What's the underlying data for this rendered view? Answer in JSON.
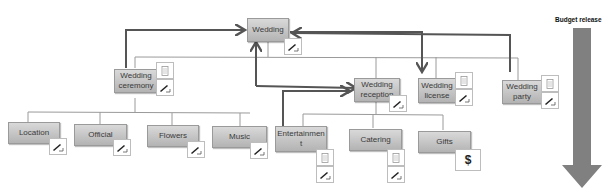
{
  "budget": {
    "label": "Budget release",
    "arrow_color": "#808080"
  },
  "root": {
    "label": "Wedding",
    "icons": [
      "pen-icon"
    ]
  },
  "level1": [
    {
      "label": "Wedding ceremony",
      "icons": [
        "document-icon",
        "pen-icon"
      ]
    },
    {
      "label": "Wedding reception",
      "icons": [
        "pen-icon"
      ]
    },
    {
      "label": "Wedding license",
      "icons": [
        "document-icon",
        "pen-icon"
      ]
    },
    {
      "label": "Wedding party",
      "icons": [
        "document-icon",
        "pen-icon"
      ]
    }
  ],
  "ceremony_children": [
    {
      "label": "Location",
      "icons": [
        "pen-icon"
      ]
    },
    {
      "label": "Official",
      "icons": [
        "pen-icon"
      ]
    },
    {
      "label": "Flowers",
      "icons": [
        "pen-icon"
      ]
    },
    {
      "label": "Music",
      "icons": [
        "pen-icon"
      ]
    }
  ],
  "reception_children": [
    {
      "label": "Entertainmen t",
      "icons": [
        "document-icon",
        "pen-icon"
      ]
    },
    {
      "label": "Catering",
      "icons": [
        "document-icon",
        "pen-icon"
      ]
    },
    {
      "label": "Gifts",
      "icons": [
        "dollar-icon"
      ],
      "icon_text": "$"
    }
  ],
  "colors": {
    "node_top": "#d9d9d9",
    "node_bottom": "#b3b3b3",
    "connector": "#9a9a9a",
    "flow_arrow": "#555555"
  }
}
